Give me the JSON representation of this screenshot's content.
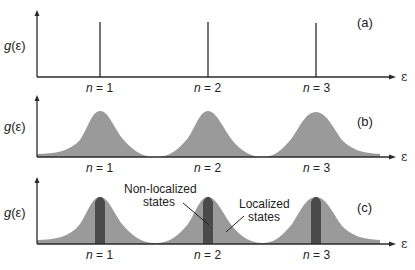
{
  "figure": {
    "y_axis_label": "g(ε)",
    "x_axis_label": "ε",
    "levels": [
      "n = 1",
      "n = 2",
      "n = 3"
    ],
    "level_symbol": "n",
    "level_values": [
      "1",
      "2",
      "3"
    ],
    "panels": [
      {
        "id": "a",
        "label": "(a)",
        "description": "Discrete delta-function levels"
      },
      {
        "id": "b",
        "label": "(b)",
        "description": "Broadened bands"
      },
      {
        "id": "c",
        "label": "(c)",
        "description": "Broadened bands with localized tails and non-localized cores",
        "annotations": [
          {
            "text_line1": "Non-localized",
            "text_line2": "states"
          },
          {
            "text_line1": "Localized",
            "text_line2": "states"
          }
        ]
      }
    ],
    "colors": {
      "axis": "#2a2a2a",
      "band_fill": "#9a9a9a",
      "core_fill": "#4a4a4a",
      "text": "#222222"
    }
  }
}
